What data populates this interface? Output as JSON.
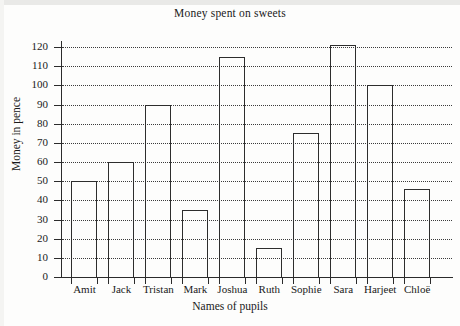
{
  "chart_data": {
    "type": "bar",
    "title": "Money spent on sweets",
    "xlabel": "Names of pupils",
    "ylabel": "Money in pence",
    "categories": [
      "Amit",
      "Jack",
      "Tristan",
      "Mark",
      "Joshua",
      "Ruth",
      "Sophie",
      "Sara",
      "Harjeet",
      "Chloë"
    ],
    "values": [
      50,
      60,
      90,
      35,
      115,
      15,
      75,
      121,
      100,
      46
    ],
    "ylim": [
      0,
      125
    ],
    "yticks": [
      0,
      10,
      20,
      30,
      40,
      50,
      60,
      70,
      80,
      90,
      100,
      110,
      120
    ],
    "ytick_labels": [
      "0",
      "10",
      "20",
      "30",
      "40",
      "50",
      "60",
      "70",
      "80",
      "90",
      "100",
      "110",
      "120"
    ],
    "grid": "horizontal-dotted",
    "legend": "none",
    "bar_style": {
      "fill": "none",
      "edge_color": "#2d2d2d"
    }
  }
}
